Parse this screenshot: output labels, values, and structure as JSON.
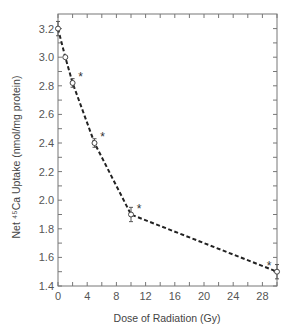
{
  "chart_data": {
    "type": "line",
    "title": "",
    "xlabel": "Dose of Radiation (Gy)",
    "ylabel": "Net ⁴⁵Ca Uptake (nmol/mg protein)",
    "xlim": [
      0,
      30
    ],
    "ylim": [
      1.4,
      3.3
    ],
    "xticks": [
      0,
      4,
      8,
      12,
      16,
      20,
      24,
      28
    ],
    "yticks": [
      1.4,
      1.6,
      1.8,
      2.0,
      2.2,
      2.4,
      2.6,
      2.8,
      3.0,
      3.2
    ],
    "grid": false,
    "series": [
      {
        "name": "Net Ca uptake",
        "x": [
          0,
          1,
          2,
          5,
          10,
          30
        ],
        "y": [
          3.2,
          3.0,
          2.82,
          2.4,
          1.9,
          1.5
        ],
        "err": [
          0.05,
          0.01,
          0.03,
          0.03,
          0.05,
          0.05
        ],
        "significant": [
          false,
          false,
          true,
          true,
          true,
          true
        ],
        "line_style": "dashed",
        "marker": "open-circle"
      }
    ],
    "annotations": [
      "*",
      "*",
      "*",
      "*"
    ]
  }
}
